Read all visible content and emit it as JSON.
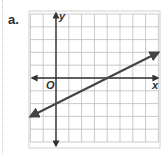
{
  "problem_label": "a.",
  "graph": {
    "x_axis_label": "x",
    "y_axis_label": "y",
    "origin_label": "O",
    "x_range": [
      -2,
      8
    ],
    "y_range": [
      -5,
      5
    ],
    "grid_unit": 1,
    "line": {
      "slope": 0.5,
      "y_intercept": -2,
      "x_intercept": 4,
      "arrows": "both"
    },
    "colors": {
      "grid": "#bdbdbd",
      "axes": "#333333",
      "line": "#444444",
      "border": "#cfcfcf"
    }
  }
}
